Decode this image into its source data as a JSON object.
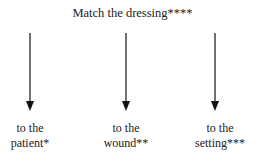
{
  "title": "Match the dressing****",
  "targets": [
    {
      "line1": "to the",
      "line2": "patient*"
    },
    {
      "line1": "to the",
      "line2": "wound**"
    },
    {
      "line1": "to the",
      "line2": "setting***"
    }
  ]
}
